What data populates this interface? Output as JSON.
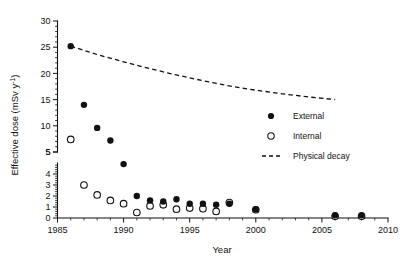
{
  "figure": {
    "background": "#ffffff",
    "ink_color": "#111111"
  },
  "chart_data": {
    "type": "scatter",
    "title": "",
    "xlabel": "Year",
    "ylabel": "Effective dose (mSv y-1)",
    "ylabel_display": "Effective dose (mSv y",
    "ylabel_exponent": "-1",
    "ylabel_tail": ")",
    "xlim": [
      1985,
      2010
    ],
    "xticks": [
      1985,
      1990,
      1995,
      2000,
      2005,
      2010
    ],
    "xtick_labels": [
      "1985",
      "1990",
      "1995",
      "2000",
      "2005",
      "2010"
    ],
    "x_minor_interval": 1,
    "grid": false,
    "broken_axis": true,
    "y_upper_segment": {
      "range": [
        5,
        30
      ],
      "ticks": [
        5,
        10,
        15,
        20,
        25,
        30
      ],
      "tick_labels": [
        "5",
        "10",
        "15",
        "20",
        "25",
        "30"
      ],
      "minor_interval": 1
    },
    "y_lower_segment": {
      "range": [
        0,
        5
      ],
      "ticks": [
        0,
        1,
        2,
        3,
        4,
        5
      ],
      "tick_labels": [
        "0",
        "1",
        "2",
        "3",
        "4",
        "5"
      ],
      "minor_interval": 0.2
    },
    "legend": {
      "position": "right-middle",
      "entries": [
        {
          "label": "External",
          "marker": "filled-circle"
        },
        {
          "label": "Internal",
          "marker": "open-circle"
        },
        {
          "label": "Physical decay",
          "marker": "dashed-line"
        }
      ]
    },
    "series": [
      {
        "name": "External",
        "marker": "filled-circle",
        "points": [
          {
            "x": 1986,
            "y": 25.2
          },
          {
            "x": 1987,
            "y": 14.0
          },
          {
            "x": 1988,
            "y": 9.6
          },
          {
            "x": 1989,
            "y": 7.2
          },
          {
            "x": 1990,
            "y": 4.9
          },
          {
            "x": 1991,
            "y": 2.0
          },
          {
            "x": 1992,
            "y": 1.6
          },
          {
            "x": 1993,
            "y": 1.5
          },
          {
            "x": 1994,
            "y": 1.7
          },
          {
            "x": 1995,
            "y": 1.3
          },
          {
            "x": 1996,
            "y": 1.3
          },
          {
            "x": 1997,
            "y": 1.2
          },
          {
            "x": 1998,
            "y": 1.3
          },
          {
            "x": 2000,
            "y": 0.8
          },
          {
            "x": 2006,
            "y": 0.25
          },
          {
            "x": 2008,
            "y": 0.25
          }
        ]
      },
      {
        "name": "Internal",
        "marker": "open-circle",
        "points": [
          {
            "x": 1986,
            "y": 7.4
          },
          {
            "x": 1987,
            "y": 3.0
          },
          {
            "x": 1988,
            "y": 2.1
          },
          {
            "x": 1989,
            "y": 1.6
          },
          {
            "x": 1990,
            "y": 1.3
          },
          {
            "x": 1991,
            "y": 0.5
          },
          {
            "x": 1992,
            "y": 1.1
          },
          {
            "x": 1993,
            "y": 1.2
          },
          {
            "x": 1994,
            "y": 0.8
          },
          {
            "x": 1995,
            "y": 0.9
          },
          {
            "x": 1996,
            "y": 0.85
          },
          {
            "x": 1997,
            "y": 0.6
          },
          {
            "x": 1998,
            "y": 1.4
          },
          {
            "x": 2000,
            "y": 0.75
          },
          {
            "x": 2006,
            "y": 0.15
          },
          {
            "x": 2008,
            "y": 0.15
          }
        ]
      }
    ],
    "decay_curve": {
      "name": "Physical decay",
      "style": "dashed",
      "points": [
        {
          "x": 1986,
          "y": 25.2
        },
        {
          "x": 1988,
          "y": 23.6
        },
        {
          "x": 1990,
          "y": 22.2
        },
        {
          "x": 1992,
          "y": 20.9
        },
        {
          "x": 1994,
          "y": 19.7
        },
        {
          "x": 1996,
          "y": 18.6
        },
        {
          "x": 1998,
          "y": 17.6
        },
        {
          "x": 2000,
          "y": 16.8
        },
        {
          "x": 2002,
          "y": 16.1
        },
        {
          "x": 2004,
          "y": 15.5
        },
        {
          "x": 2006,
          "y": 15.0
        }
      ]
    }
  }
}
